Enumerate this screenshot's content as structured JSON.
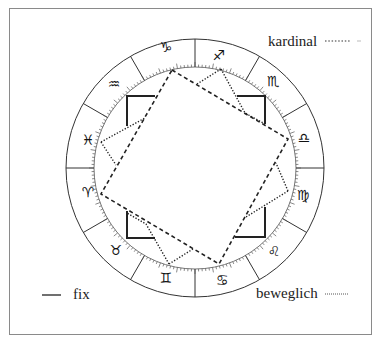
{
  "legend": {
    "cardinal": {
      "label": "kardinal",
      "style": "dotted"
    },
    "mutable": {
      "label": "beweglich",
      "style": "fine-dotted"
    },
    "fixed": {
      "label": "fix",
      "style": "solid"
    }
  },
  "chart": {
    "center": [
      195,
      168
    ],
    "outer_radius": 129,
    "inner_radius": 101,
    "sign_dividers_deg": [
      0,
      30,
      60,
      90,
      120,
      150,
      180,
      210,
      240,
      270,
      300,
      330
    ],
    "signs": [
      {
        "name": "Steinbock",
        "glyph": "♑",
        "x": 166,
        "y": 48
      },
      {
        "name": "Schütze",
        "glyph": "♐",
        "x": 219,
        "y": 56
      },
      {
        "name": "Skorpion",
        "glyph": "♏",
        "x": 273,
        "y": 82
      },
      {
        "name": "Waage",
        "glyph": "♎",
        "x": 304,
        "y": 139
      },
      {
        "name": "Jungfrau",
        "glyph": "♍",
        "x": 303,
        "y": 196
      },
      {
        "name": "Löwe",
        "glyph": "♌",
        "x": 274,
        "y": 252
      },
      {
        "name": "Krebs",
        "glyph": "♋",
        "x": 222,
        "y": 281
      },
      {
        "name": "Zwillinge",
        "glyph": "♊",
        "x": 166,
        "y": 279
      },
      {
        "name": "Stier",
        "glyph": "♉",
        "x": 116,
        "y": 251
      },
      {
        "name": "Widder",
        "glyph": "♈",
        "x": 88,
        "y": 193
      },
      {
        "name": "Fische",
        "glyph": "♓",
        "x": 88,
        "y": 141
      },
      {
        "name": "Wassermann",
        "glyph": "♒",
        "x": 114,
        "y": 85
      }
    ]
  }
}
